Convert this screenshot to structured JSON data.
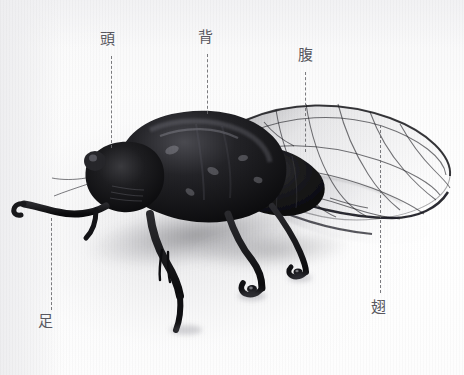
{
  "figure": {
    "photo_style": "black-and-white photograph on white background",
    "ink_color": "#585860",
    "leader_line_color": "#6a6a6e",
    "background_color": "#fdfdfd",
    "body_color": "#141416"
  },
  "annotations": [
    {
      "id": "head",
      "label": "頭",
      "label_x": 100,
      "label_y": 32,
      "line_x": 111,
      "line_top": 56,
      "line_height": 92
    },
    {
      "id": "back",
      "label": "背",
      "label_x": 198,
      "label_y": 30,
      "line_x": 207,
      "line_top": 54,
      "line_height": 60
    },
    {
      "id": "abdomen",
      "label": "腹",
      "label_x": 298,
      "label_y": 48,
      "line_x": 305,
      "line_top": 72,
      "line_height": 80
    },
    {
      "id": "wing",
      "label": "翅",
      "label_x": 371,
      "label_y": 300,
      "line_x": 380,
      "line_top": 125,
      "line_height": 168
    },
    {
      "id": "leg",
      "label": "足",
      "label_x": 38,
      "label_y": 314,
      "line_x": 51,
      "line_top": 218,
      "line_height": 92
    }
  ]
}
